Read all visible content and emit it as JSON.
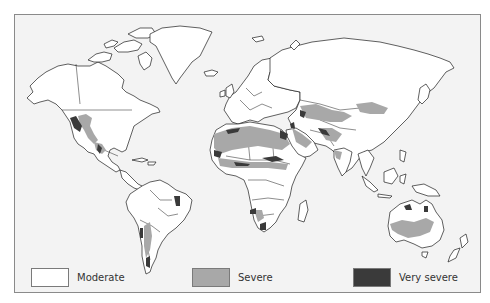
{
  "map": {
    "type": "world-map",
    "subject": "Drylands degradation severity by region",
    "colors": {
      "background": "#f3f3f3",
      "land": "#ffffff",
      "outline": "#1c1c1c",
      "frame": "#8a8a8a"
    }
  },
  "legend": {
    "items": [
      {
        "label": "Moderate",
        "color": "#ffffff"
      },
      {
        "label": "Severe",
        "color": "#a8a8a8"
      },
      {
        "label": "Very severe",
        "color": "#3a3a3a"
      }
    ]
  }
}
